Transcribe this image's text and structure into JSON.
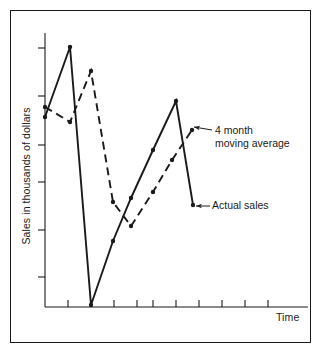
{
  "figure": {
    "title": "",
    "axis_labels": {
      "y": "Sales in thousands of dollars",
      "x": "Time"
    },
    "annotations": {
      "moving_average": "4 month\nmoving average",
      "actual_sales": "Actual sales"
    },
    "colors": {
      "ink": "#1a1a1a",
      "background": "#ffffff",
      "frame": "#1a1a1a"
    }
  },
  "chart_data": {
    "type": "line",
    "title": "",
    "xlabel": "Time",
    "ylabel": "Sales in thousands of dollars",
    "xlim": [
      0,
      12
    ],
    "ylim": [
      0,
      6
    ],
    "grid": false,
    "legend": "annotations",
    "x_tick_labels": [],
    "y_tick_labels": [],
    "x_ticks": [
      1,
      2,
      3,
      4,
      5,
      6,
      7,
      8,
      9,
      10,
      11
    ],
    "y_ticks": [
      1,
      2,
      3,
      4,
      5,
      6
    ],
    "series": [
      {
        "name": "Actual sales",
        "style": "solid",
        "marker": "dot",
        "x": [
          0,
          1,
          2,
          3,
          4,
          5,
          6,
          7
        ],
        "values": [
          3.95,
          5.4,
          0.05,
          1.35,
          2.8,
          3.65,
          4.45,
          2.1
        ],
        "points_px": [
          [
            45,
            117
          ],
          [
            70,
            47
          ],
          [
            91,
            305
          ],
          [
            113,
            241
          ],
          [
            131,
            198
          ],
          [
            153,
            150
          ],
          [
            176,
            101
          ],
          [
            193,
            205
          ]
        ]
      },
      {
        "name": "4 month moving average",
        "style": "dashed",
        "marker": "dot",
        "x": [
          0,
          1,
          2,
          3,
          4,
          5,
          6,
          7
        ],
        "values": [
          4.1,
          3.85,
          4.95,
          1.9,
          1.55,
          2.2,
          3.0,
          3.6
        ],
        "points_px": [
          [
            45,
            107
          ],
          [
            70,
            122
          ],
          [
            91,
            71
          ],
          [
            113,
            202
          ],
          [
            131,
            226
          ],
          [
            153,
            192
          ],
          [
            172,
            160
          ],
          [
            192,
            130
          ]
        ]
      }
    ]
  },
  "plot_geometry": {
    "axis_origin_px": [
      45,
      307
    ],
    "x_axis_end_px": [
      308,
      307
    ],
    "y_axis_top_px": [
      45,
      33
    ],
    "x_tick_px": [
      68,
      91,
      114,
      137,
      153,
      176,
      199,
      222,
      245,
      268
    ],
    "y_tick_px": [
      48,
      96,
      145,
      182,
      230,
      277
    ]
  }
}
